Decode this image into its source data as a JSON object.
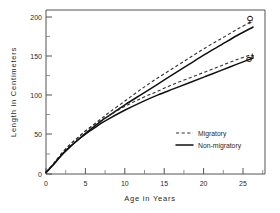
{
  "chart_data": {
    "type": "line",
    "title": "",
    "xlabel": "Age  in  Years",
    "ylabel": "Length  in  Centimeters",
    "xlim": [
      0,
      27.5
    ],
    "ylim": [
      0,
      212
    ],
    "grid": false,
    "x_ticks": [
      0,
      5,
      10,
      15,
      20,
      25
    ],
    "x_tick_labels": [
      "0",
      "5",
      "10",
      "15",
      "20",
      "25"
    ],
    "x_minor_ticks": [
      2.5,
      7.5,
      12.5,
      17.5,
      22.5
    ],
    "y_ticks": [
      0,
      50,
      100,
      150,
      200
    ],
    "y_tick_labels": [
      "0",
      "50",
      "100",
      "150",
      "200"
    ],
    "y_minor_ticks": [
      25,
      75,
      125,
      175
    ],
    "legend_position": "center-right",
    "legend": [
      {
        "label": "Migratory",
        "style": "dashed"
      },
      {
        "label": "Non-migratory",
        "style": "solid"
      }
    ],
    "annotations": [
      {
        "text": "♀",
        "name": "female-symbol",
        "x": 26.6,
        "y": 200
      },
      {
        "text": "♂",
        "name": "male-symbol",
        "x": 26.6,
        "y": 152
      }
    ],
    "x": [
      0,
      1,
      2,
      3,
      4,
      5,
      6,
      7,
      8,
      10,
      12,
      14,
      16,
      18,
      20,
      22,
      24,
      26
    ],
    "series": [
      {
        "name": "Female Migratory",
        "group": "female",
        "style": "dashed",
        "color": "#333333",
        "values": [
          2,
          14,
          27,
          38,
          47,
          56,
          64,
          72,
          80,
          95,
          110,
          124,
          137,
          150,
          163,
          175,
          187,
          198
        ]
      },
      {
        "name": "Female Non-migratory",
        "group": "female",
        "style": "solid",
        "color": "#111111",
        "values": [
          2,
          13,
          25,
          35,
          44,
          53,
          61,
          69,
          76,
          90,
          103,
          116,
          129,
          142,
          155,
          167,
          179,
          190
        ]
      },
      {
        "name": "Male Migratory",
        "group": "male",
        "style": "dashed",
        "color": "#333333",
        "values": [
          2,
          14,
          27,
          38,
          47,
          56,
          63,
          70,
          76,
          88,
          98,
          107,
          116,
          124,
          132,
          140,
          148,
          155
        ]
      },
      {
        "name": "Male Non-migratory",
        "group": "male",
        "style": "solid",
        "color": "#111111",
        "values": [
          2,
          13,
          25,
          35,
          44,
          52,
          59,
          66,
          72,
          83,
          93,
          102,
          110,
          118,
          126,
          134,
          142,
          150
        ]
      }
    ]
  }
}
